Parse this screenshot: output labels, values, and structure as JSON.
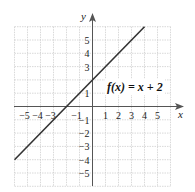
{
  "chart_data": {
    "type": "line",
    "title": "",
    "xlabel": "x",
    "ylabel": "y",
    "xlim": [
      -6,
      6
    ],
    "ylim": [
      -6,
      6
    ],
    "grid": true,
    "x_ticks": [
      -5,
      -4,
      -3,
      -1,
      1,
      2,
      3,
      4,
      5
    ],
    "y_ticks": [
      5,
      4,
      3,
      1,
      -1,
      -2,
      -3,
      -4,
      -5
    ],
    "x_tick_labels": [
      "−5",
      "−4",
      "−3",
      "−1",
      "1",
      "2",
      "3",
      "4",
      "5"
    ],
    "y_tick_labels": [
      "5",
      "4",
      "3",
      "1",
      "−1",
      "−2",
      "−3",
      "−4",
      "−5"
    ],
    "series": [
      {
        "name": "f(x) = x + 2",
        "equation": "y = x + 2",
        "x": [
          -6,
          4
        ],
        "y": [
          -4,
          6
        ]
      }
    ],
    "annotations": [
      {
        "text": "f(x) = x + 2",
        "x": 3.3,
        "y": 1.6
      }
    ]
  },
  "labels": {
    "x_axis": "x",
    "y_axis": "y",
    "function": "f(x) = x + 2"
  },
  "colors": {
    "grid": "#c8c8c8",
    "axis": "#333333",
    "line": "#333333"
  }
}
